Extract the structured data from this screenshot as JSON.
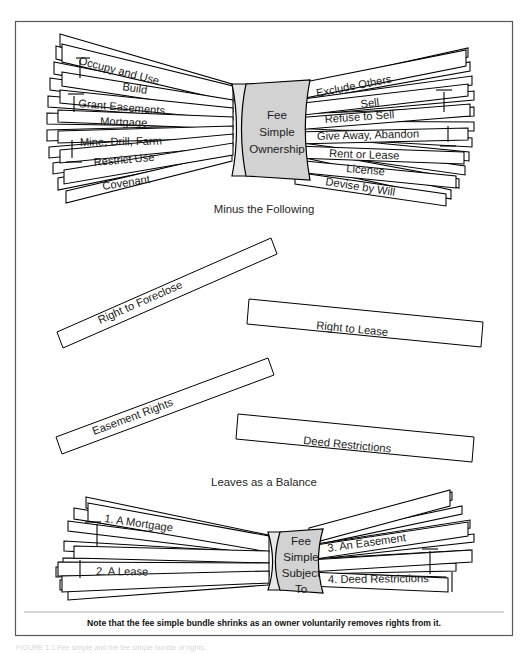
{
  "figure": {
    "title_note": "Note that the fee simple bundle shrinks as an owner voluntarily removes rights from it.",
    "caption_faint": "FIGURE 1.1  Fee simple and the fee simple bundle of rights."
  },
  "top_bundle": {
    "center_line1": "Fee",
    "center_line2": "Simple",
    "center_line3": "Ownership",
    "left_rights": [
      "Occupy and Use",
      "Build",
      "Grant Easements",
      "Mortgage",
      "Mine, Drill, Farm",
      "Restrict Use",
      "Covenant"
    ],
    "right_rights": [
      "Exclude Others",
      "Sell",
      "Refuse to Sell",
      "Give Away, Abandon",
      "Rent or Lease",
      "License",
      "Devise by Will"
    ]
  },
  "divider_labels": {
    "minus": "Minus the Following",
    "leaves": "Leaves as a Balance"
  },
  "removed_sticks": [
    {
      "label": "Right to Foreclose"
    },
    {
      "label": "Right to Lease"
    },
    {
      "label": "Easement Rights"
    },
    {
      "label": "Deed Restrictions"
    }
  ],
  "bottom_bundle": {
    "center_line1": "Fee",
    "center_line2": "Simple",
    "center_line3": "Subject",
    "center_line4": "To",
    "left_items": [
      "1. A Mortgage",
      "2. A Lease"
    ],
    "right_items": [
      "3. An Easement",
      "4. Deed Restrictions"
    ]
  },
  "colors": {
    "band_fill": "#d2d2d2",
    "stick_fill": "#ffffff",
    "stroke": "#000000",
    "frame": "#585858",
    "page": "#ffffff"
  }
}
